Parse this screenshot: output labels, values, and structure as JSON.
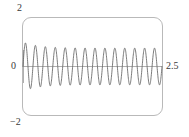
{
  "figure": {
    "kind": "mathematica-plot",
    "frame_color": "#b9b9b9",
    "curve_color": "#6b6b6b",
    "axis_color": "#9a9a9a",
    "label_color": "#3a3a3a",
    "background": "#ffffff"
  },
  "labels": {
    "top": "2",
    "left": "0",
    "bottom": "−2",
    "right": "2.5"
  },
  "chart_data": {
    "type": "line",
    "title": "",
    "subtitle": "",
    "xlabel": "",
    "ylabel": "",
    "xlim": [
      0,
      2.5
    ],
    "ylim": [
      -2,
      2
    ],
    "xticks": [
      2.5
    ],
    "xticklabels": [
      "2.5"
    ],
    "yticks": [
      -2,
      0,
      2
    ],
    "yticklabels": [
      "−2",
      "0",
      "2"
    ],
    "grid": false,
    "legend": null,
    "legend_position": "none",
    "annotations": [],
    "series": [
      {
        "name": "oscillation",
        "color": "#6b6b6b",
        "description": "Rapid oscillation of roughly 14 cycles across x in [0, 2.5]; first crest is tallest (~1.0) then the envelope settles to a nearly constant amplitude of about 0.75.",
        "approx_cycles": 14,
        "envelope_start": 1.0,
        "envelope_steady": 0.75,
        "x": [
          0.0,
          0.045,
          0.089,
          0.134,
          0.179,
          0.223,
          0.268,
          0.313,
          0.357,
          0.402,
          0.446,
          0.491,
          0.536,
          0.58,
          0.625,
          0.67,
          0.714,
          0.759,
          0.804,
          0.848,
          0.893,
          0.938,
          0.982,
          1.027,
          1.071,
          1.116,
          1.161,
          1.205,
          1.25,
          1.295,
          1.339,
          1.384,
          1.429,
          1.473,
          1.518,
          1.563,
          1.607,
          1.652,
          1.696,
          1.741,
          1.786,
          1.83,
          1.875,
          1.92,
          1.964,
          2.009,
          2.054,
          2.098,
          2.143,
          2.188,
          2.232,
          2.277,
          2.321,
          2.366,
          2.411,
          2.455,
          2.5
        ],
        "y": [
          0.0,
          0.78,
          0.98,
          0.42,
          -0.62,
          -0.86,
          -0.33,
          0.55,
          0.8,
          0.36,
          -0.52,
          -0.78,
          -0.35,
          0.5,
          0.76,
          0.34,
          -0.49,
          -0.75,
          -0.34,
          0.48,
          0.75,
          0.34,
          -0.48,
          -0.75,
          -0.34,
          0.48,
          0.75,
          0.34,
          -0.48,
          -0.75,
          -0.34,
          0.48,
          0.75,
          0.34,
          -0.48,
          -0.75,
          -0.34,
          0.48,
          0.75,
          0.34,
          -0.48,
          -0.75,
          -0.34,
          0.48,
          0.75,
          0.34,
          -0.48,
          -0.75,
          -0.34,
          0.48,
          0.75,
          0.34,
          -0.48,
          -0.75,
          -0.34,
          0.48,
          0.75
        ]
      }
    ]
  }
}
